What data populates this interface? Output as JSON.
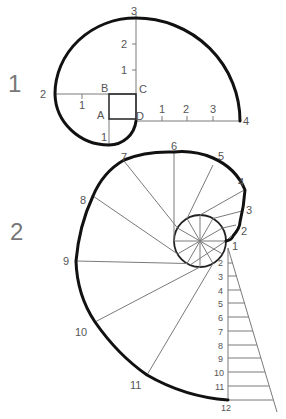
{
  "figures": [
    {
      "number": "1",
      "square_labels": {
        "A": "A",
        "B": "B",
        "C": "C",
        "D": "D"
      },
      "spiral_points": [
        "1",
        "2",
        "3",
        "4"
      ],
      "vertical_ticks": [
        "1",
        "2"
      ],
      "horizontal_ticks_right": [
        "1",
        "2",
        "3"
      ],
      "left_tick": "1"
    },
    {
      "number": "2",
      "spiral_points": [
        "1",
        "2",
        "3",
        "4",
        "5",
        "6",
        "7",
        "8",
        "9",
        "10",
        "11",
        "12"
      ],
      "scale_labels": [
        "2",
        "3",
        "4",
        "5",
        "6",
        "7",
        "8",
        "9",
        "10",
        "11",
        "12"
      ]
    }
  ],
  "colors": {
    "curve": "#111111",
    "construction": "#7a7a7a",
    "label": "#555555"
  }
}
